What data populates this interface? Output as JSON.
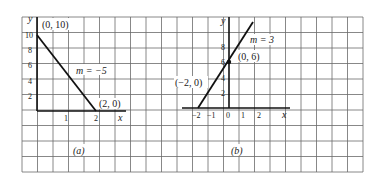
{
  "figure": {
    "grid": {
      "x0": 22,
      "y0": 17,
      "x1": 363,
      "y1": 172,
      "step": 15.5,
      "color": "#555555"
    },
    "panels": [
      {
        "id": "a",
        "caption": "(a)",
        "y_axis_label": "y",
        "x_axis_label": "x",
        "y_ticks": [
          "10",
          "8",
          "6",
          "4",
          "2"
        ],
        "x_ticks": [
          "1",
          "2"
        ],
        "line_label": "m = −5",
        "points": [
          {
            "label": "(0, 10)",
            "x": 0,
            "y": 10
          },
          {
            "label": "(2, 0)",
            "x": 2,
            "y": 0
          }
        ],
        "slope": -5
      },
      {
        "id": "b",
        "caption": "(b)",
        "y_axis_label": "y",
        "x_axis_label": "x",
        "y_ticks": [
          "8",
          "6",
          "4",
          "2"
        ],
        "x_ticks": [
          "−2",
          "−1",
          "0",
          "1",
          "2"
        ],
        "line_label": "m = 3",
        "points": [
          {
            "label": "(−2, 0)",
            "x": -2,
            "y": 0
          },
          {
            "label": "(0, 6)",
            "x": 0,
            "y": 6
          }
        ],
        "slope": 3
      }
    ]
  }
}
